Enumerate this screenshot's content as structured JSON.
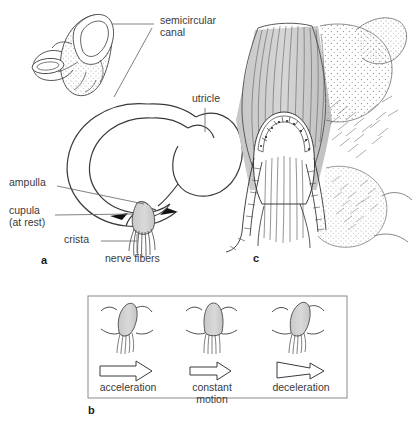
{
  "figure": {
    "background": "#ffffff",
    "line_color": "#333333",
    "text_color": "#3a3a3a",
    "cupula_fill": "#d4d4d4",
    "stipple_color": "#9a9a9a"
  },
  "panels": [
    {
      "letter": "a",
      "x": 41,
      "y": 258,
      "description": "Semicircular canal loop with utricle and ampulla containing cupula and crista"
    },
    {
      "letter": "b",
      "x": 88,
      "y": 408,
      "description": "Cupula deflection during acceleration, constant motion and deceleration"
    },
    {
      "letter": "c",
      "x": 253,
      "y": 258,
      "description": "Detailed histological view of crista ampullaris with hair cells and cupula"
    }
  ],
  "panel_a": {
    "labels": [
      {
        "name": "semicircular-canal",
        "text": "semicircular\ncanal",
        "x": 160,
        "y": 18,
        "leader": {
          "x1": 154,
          "y1": 24,
          "x2": 108,
          "y2": 26,
          "x3": 152,
          "y3": 27,
          "x4": 112,
          "y4": 97
        }
      },
      {
        "name": "utricle",
        "text": "utricle",
        "x": 192,
        "y": 96,
        "leader": {
          "x1": 205,
          "y1": 110,
          "x2": 205,
          "y2": 133
        }
      },
      {
        "name": "ampulla",
        "text": "ampulla",
        "x": 9,
        "y": 180,
        "leader": {
          "x1": 57,
          "y1": 186,
          "x2": 141,
          "y2": 202
        }
      },
      {
        "name": "cupula-at-rest",
        "text": "cupula\n(at rest)",
        "x": 9,
        "y": 208,
        "leader": {
          "x1": 55,
          "y1": 215,
          "x2": 132,
          "y2": 216
        }
      },
      {
        "name": "crista",
        "text": "crista",
        "x": 66,
        "y": 237,
        "leader": {
          "x1": 101,
          "y1": 242,
          "x2": 136,
          "y2": 242
        }
      },
      {
        "name": "nerve-fibers",
        "text": "nerve fibers",
        "x": 107,
        "y": 256,
        "leader": {
          "x1": 136,
          "y1": 255,
          "x2": 136,
          "y2": 234
        }
      }
    ]
  },
  "panel_b": {
    "box": {
      "x": 88,
      "y": 296,
      "width": 259,
      "height": 102
    },
    "states": [
      {
        "name": "acceleration",
        "label": "acceleration",
        "cupula_tilt": "right-strong",
        "arrow": "thick",
        "cx": 127,
        "label_x": 127,
        "label_y": 375
      },
      {
        "name": "constant-motion",
        "label": "constant\nmotion",
        "cupula_tilt": "upright",
        "arrow": "medium",
        "cx": 212,
        "label_x": 212,
        "label_y": 375
      },
      {
        "name": "deceleration",
        "label": "deceleration",
        "cupula_tilt": "right-lean",
        "arrow": "thin",
        "cx": 300,
        "label_x": 300,
        "label_y": 375
      }
    ]
  }
}
